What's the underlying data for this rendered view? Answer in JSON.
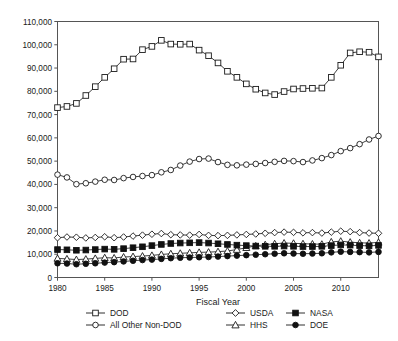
{
  "chart_data": {
    "type": "line",
    "title": "",
    "xlabel": "Fiscal Year",
    "ylabel": "",
    "xlim": [
      1980,
      2014
    ],
    "ylim": [
      0,
      110000
    ],
    "grid": false,
    "legend_position": "bottom",
    "xticks": [
      "1980",
      "1985",
      "1990",
      "1995",
      "2000",
      "2005",
      "2010"
    ],
    "xtick_values": [
      1980,
      1985,
      1990,
      1995,
      2000,
      2005,
      2010
    ],
    "yticks": [
      "0",
      "10,000",
      "20,000",
      "30,000",
      "40,000",
      "50,000",
      "60,000",
      "70,000",
      "80,000",
      "90,000",
      "100,000",
      "110,000"
    ],
    "ytick_values": [
      0,
      10000,
      20000,
      30000,
      40000,
      50000,
      60000,
      70000,
      80000,
      90000,
      100000,
      110000
    ],
    "x": [
      1980,
      1981,
      1982,
      1983,
      1984,
      1985,
      1986,
      1987,
      1988,
      1989,
      1990,
      1991,
      1992,
      1993,
      1994,
      1995,
      1996,
      1997,
      1998,
      1999,
      2000,
      2001,
      2002,
      2003,
      2004,
      2005,
      2006,
      2007,
      2008,
      2009,
      2010,
      2011,
      2012,
      2013,
      2014
    ],
    "series": [
      {
        "name": "DOD",
        "marker": "open-square",
        "values": [
          73000,
          73500,
          74800,
          78200,
          82000,
          86000,
          89700,
          93800,
          93900,
          97900,
          99300,
          101900,
          100300,
          100200,
          100300,
          97700,
          95300,
          92200,
          88600,
          86000,
          83200,
          80900,
          79300,
          78600,
          79900,
          81000,
          81200,
          81300,
          81400,
          86000,
          91200,
          96500,
          97000,
          96800,
          94800
        ]
      },
      {
        "name": "All Other Non-DOD",
        "marker": "open-circle",
        "values": [
          44200,
          43000,
          40100,
          40500,
          41200,
          42000,
          41900,
          42700,
          43200,
          43600,
          44000,
          45200,
          46200,
          48100,
          49800,
          50900,
          51100,
          49600,
          48400,
          48200,
          48500,
          48800,
          49200,
          49700,
          50100,
          50000,
          49600,
          50300,
          51300,
          52600,
          54300,
          55600,
          57300,
          59300,
          60800
        ]
      },
      {
        "name": "USDA",
        "marker": "open-diamond",
        "values": [
          17100,
          17400,
          17300,
          17000,
          17200,
          17500,
          17100,
          17400,
          17800,
          18200,
          18600,
          18900,
          18400,
          18300,
          18200,
          18500,
          18100,
          18000,
          18100,
          18300,
          18500,
          18700,
          19000,
          19300,
          19500,
          19400,
          19200,
          19300,
          19100,
          19500,
          19900,
          19700,
          19300,
          19100,
          19000
        ]
      },
      {
        "name": "HHS",
        "marker": "open-triangle",
        "values": [
          8200,
          8000,
          7700,
          7900,
          8200,
          8500,
          8400,
          8800,
          9000,
          9200,
          9500,
          9900,
          10200,
          10400,
          10600,
          10800,
          10900,
          11100,
          11400,
          12000,
          12800,
          13600,
          14100,
          14500,
          14800,
          14700,
          14500,
          14400,
          14300,
          15300,
          15600,
          15200,
          14900,
          14800,
          15100
        ]
      },
      {
        "name": "NASA",
        "marker": "filled-square",
        "values": [
          12000,
          11900,
          11700,
          11800,
          12000,
          12200,
          12100,
          12400,
          12800,
          13200,
          13700,
          14200,
          14600,
          14800,
          14900,
          15000,
          14800,
          14500,
          14200,
          13900,
          13700,
          13500,
          13400,
          13400,
          13500,
          13400,
          13300,
          13300,
          13400,
          13700,
          14000,
          13900,
          13700,
          13600,
          13800
        ]
      },
      {
        "name": "DOE",
        "marker": "filled-circle",
        "values": [
          6100,
          6000,
          5700,
          5900,
          6100,
          6400,
          6600,
          6900,
          7200,
          7500,
          7700,
          8000,
          8300,
          8500,
          8600,
          8700,
          8800,
          9000,
          9200,
          9400,
          9600,
          9800,
          10000,
          10200,
          10400,
          10300,
          10200,
          10300,
          10400,
          10800,
          11100,
          11000,
          10900,
          10800,
          11000
        ]
      }
    ],
    "legend": [
      {
        "label": "DOD",
        "marker": "open-square"
      },
      {
        "label": "USDA",
        "marker": "open-diamond"
      },
      {
        "label": "NASA",
        "marker": "filled-square"
      },
      {
        "label": "All Other Non-DOD",
        "marker": "open-circle"
      },
      {
        "label": "HHS",
        "marker": "open-triangle"
      },
      {
        "label": "DOE",
        "marker": "filled-circle"
      }
    ]
  }
}
